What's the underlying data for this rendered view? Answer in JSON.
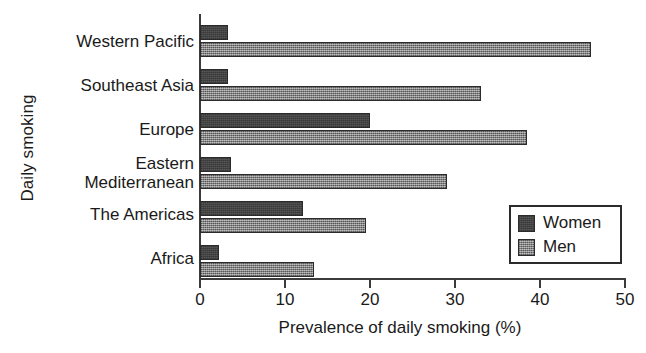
{
  "chart_data": {
    "type": "bar",
    "orientation": "horizontal",
    "title": "",
    "xlabel": "Prevalence of daily smoking (%)",
    "ylabel": "Daily smoking",
    "xlim": [
      0,
      50
    ],
    "xticks": [
      0,
      10,
      20,
      30,
      40,
      50
    ],
    "xtick_labels": [
      "0",
      "10",
      "20",
      "30",
      "40",
      "50"
    ],
    "grid": false,
    "legend_position": "lower-right",
    "categories": [
      "Western Pacific",
      "Southeast Asia",
      "Europe",
      "Eastern\nMediterranean",
      "The Americas",
      "Africa"
    ],
    "series": [
      {
        "name": "Women",
        "color": "#4d4d4d",
        "values": [
          3.3,
          3.3,
          20.0,
          3.6,
          12.1,
          2.2
        ]
      },
      {
        "name": "Men",
        "color": "#8a8a8a",
        "values": [
          46.0,
          33.0,
          38.5,
          29.0,
          19.5,
          13.4
        ]
      }
    ]
  },
  "legend": {
    "items": [
      {
        "label": "Women",
        "swatch": "women"
      },
      {
        "label": "Men",
        "swatch": "men"
      }
    ]
  }
}
